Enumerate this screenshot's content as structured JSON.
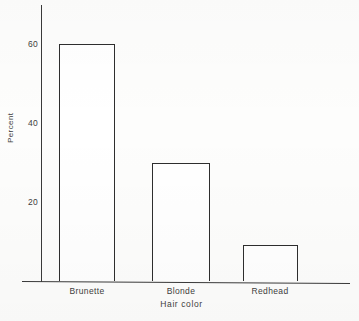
{
  "chart_data": {
    "type": "bar",
    "title": "",
    "subtitle": "",
    "xlabel": "Hair color",
    "ylabel": "Percent",
    "categories": [
      "Brunette",
      "Blonde",
      "Redhead"
    ],
    "values": [
      60,
      30,
      9
    ],
    "ylim": [
      0,
      70
    ],
    "yticks": [
      20,
      40,
      60
    ],
    "ytick_labels": [
      "20",
      "40",
      "60"
    ],
    "grid": false,
    "legend": null,
    "legend_position": "none",
    "bar_fill_color": "#ffffff",
    "bar_edge_color": "#2e2e2e",
    "axis_color": "#3a3a3a",
    "background_color": "#fdfdfc",
    "annotations": []
  },
  "figure": {
    "name": "hair-color-bar-chart",
    "axis_y_title": "Percent",
    "axis_x_title": "Hair color"
  }
}
